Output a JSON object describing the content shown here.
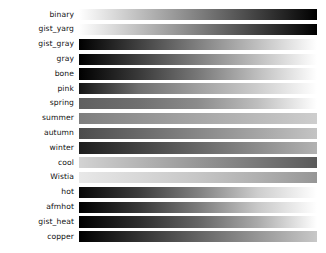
{
  "figure": {
    "background": "#ffffff",
    "label_color": "#121212",
    "bar_left_px": 79,
    "bar_width_px": 238,
    "bar_height_px": 11.2,
    "row_pitch_px": 14.8,
    "first_row_top_px": 7.6,
    "rendering": "grayscale (luminance) preview of sequential colormaps"
  },
  "chart_data": {
    "type": "heatmap",
    "title": "",
    "xlabel": "",
    "ylabel": "",
    "orientation": "horizontal",
    "x": [
      0,
      0.1,
      0.2,
      0.3,
      0.4,
      0.5,
      0.6,
      0.7,
      0.8,
      0.9,
      1.0
    ],
    "xlim": [
      0,
      1
    ],
    "grid": false,
    "legend": "none",
    "colormaps": [
      {
        "name": "binary",
        "stops": [
          {
            "t": 0.0,
            "gray": 255
          },
          {
            "t": 0.25,
            "gray": 191
          },
          {
            "t": 0.5,
            "gray": 128
          },
          {
            "t": 0.75,
            "gray": 64
          },
          {
            "t": 1.0,
            "gray": 0
          }
        ]
      },
      {
        "name": "gist_yarg",
        "stops": [
          {
            "t": 0.0,
            "gray": 255
          },
          {
            "t": 0.25,
            "gray": 191
          },
          {
            "t": 0.5,
            "gray": 128
          },
          {
            "t": 0.75,
            "gray": 64
          },
          {
            "t": 1.0,
            "gray": 0
          }
        ]
      },
      {
        "name": "gist_gray",
        "stops": [
          {
            "t": 0.0,
            "gray": 0
          },
          {
            "t": 0.25,
            "gray": 64
          },
          {
            "t": 0.5,
            "gray": 128
          },
          {
            "t": 0.75,
            "gray": 191
          },
          {
            "t": 1.0,
            "gray": 255
          }
        ]
      },
      {
        "name": "gray",
        "stops": [
          {
            "t": 0.0,
            "gray": 0
          },
          {
            "t": 0.25,
            "gray": 64
          },
          {
            "t": 0.5,
            "gray": 128
          },
          {
            "t": 0.75,
            "gray": 191
          },
          {
            "t": 1.0,
            "gray": 255
          }
        ]
      },
      {
        "name": "bone",
        "stops": [
          {
            "t": 0.0,
            "gray": 0
          },
          {
            "t": 0.25,
            "gray": 57
          },
          {
            "t": 0.5,
            "gray": 120
          },
          {
            "t": 0.75,
            "gray": 190
          },
          {
            "t": 1.0,
            "gray": 255
          }
        ]
      },
      {
        "name": "pink",
        "stops": [
          {
            "t": 0.0,
            "gray": 20
          },
          {
            "t": 0.25,
            "gray": 110
          },
          {
            "t": 0.5,
            "gray": 160
          },
          {
            "t": 0.75,
            "gray": 205
          },
          {
            "t": 1.0,
            "gray": 255
          }
        ]
      },
      {
        "name": "spring",
        "stops": [
          {
            "t": 0.0,
            "gray": 95
          },
          {
            "t": 0.25,
            "gray": 112
          },
          {
            "t": 0.5,
            "gray": 140
          },
          {
            "t": 0.75,
            "gray": 190
          },
          {
            "t": 1.0,
            "gray": 255
          }
        ]
      },
      {
        "name": "summer",
        "stops": [
          {
            "t": 0.0,
            "gray": 126
          },
          {
            "t": 0.25,
            "gray": 146
          },
          {
            "t": 0.5,
            "gray": 166
          },
          {
            "t": 0.75,
            "gray": 186
          },
          {
            "t": 1.0,
            "gray": 206
          }
        ]
      },
      {
        "name": "autumn",
        "stops": [
          {
            "t": 0.0,
            "gray": 76
          },
          {
            "t": 0.25,
            "gray": 105
          },
          {
            "t": 0.5,
            "gray": 135
          },
          {
            "t": 0.75,
            "gray": 165
          },
          {
            "t": 1.0,
            "gray": 196
          }
        ]
      },
      {
        "name": "winter",
        "stops": [
          {
            "t": 0.0,
            "gray": 29
          },
          {
            "t": 0.25,
            "gray": 66
          },
          {
            "t": 0.5,
            "gray": 103
          },
          {
            "t": 0.75,
            "gray": 140
          },
          {
            "t": 1.0,
            "gray": 178
          }
        ]
      },
      {
        "name": "cool",
        "stops": [
          {
            "t": 0.0,
            "gray": 211
          },
          {
            "t": 0.25,
            "gray": 181
          },
          {
            "t": 0.5,
            "gray": 150
          },
          {
            "t": 0.75,
            "gray": 120
          },
          {
            "t": 1.0,
            "gray": 90
          }
        ]
      },
      {
        "name": "Wistia",
        "stops": [
          {
            "t": 0.0,
            "gray": 232
          },
          {
            "t": 0.25,
            "gray": 216
          },
          {
            "t": 0.5,
            "gray": 198
          },
          {
            "t": 0.75,
            "gray": 176
          },
          {
            "t": 1.0,
            "gray": 150
          }
        ]
      },
      {
        "name": "hot",
        "stops": [
          {
            "t": 0.0,
            "gray": 8
          },
          {
            "t": 0.25,
            "gray": 60
          },
          {
            "t": 0.5,
            "gray": 128
          },
          {
            "t": 0.75,
            "gray": 205
          },
          {
            "t": 1.0,
            "gray": 255
          }
        ]
      },
      {
        "name": "afmhot",
        "stops": [
          {
            "t": 0.0,
            "gray": 0
          },
          {
            "t": 0.25,
            "gray": 55
          },
          {
            "t": 0.5,
            "gray": 123
          },
          {
            "t": 0.75,
            "gray": 200
          },
          {
            "t": 1.0,
            "gray": 255
          }
        ]
      },
      {
        "name": "gist_heat",
        "stops": [
          {
            "t": 0.0,
            "gray": 0
          },
          {
            "t": 0.25,
            "gray": 45
          },
          {
            "t": 0.5,
            "gray": 100
          },
          {
            "t": 0.75,
            "gray": 170
          },
          {
            "t": 1.0,
            "gray": 255
          }
        ]
      },
      {
        "name": "copper",
        "stops": [
          {
            "t": 0.0,
            "gray": 0
          },
          {
            "t": 0.25,
            "gray": 50
          },
          {
            "t": 0.5,
            "gray": 100
          },
          {
            "t": 0.75,
            "gray": 150
          },
          {
            "t": 1.0,
            "gray": 200
          }
        ]
      }
    ]
  }
}
